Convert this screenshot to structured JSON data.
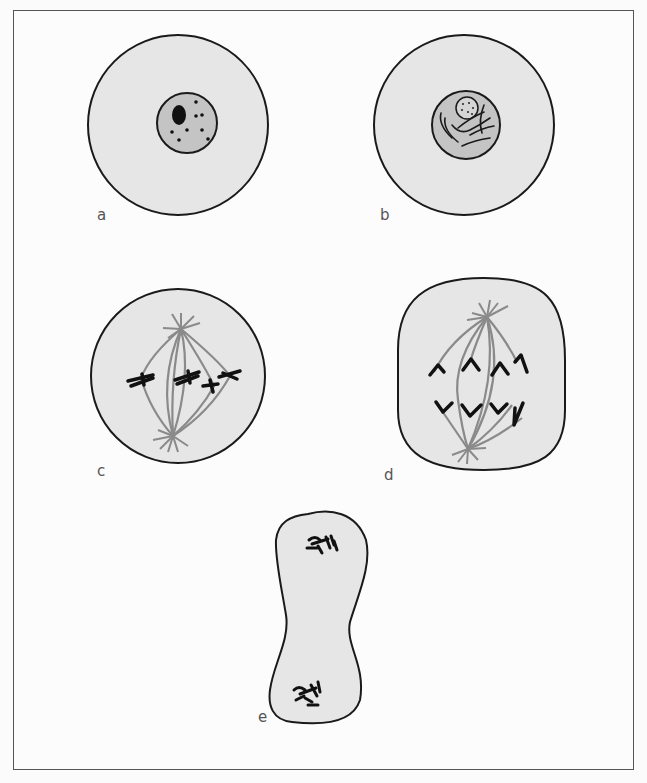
{
  "figure": {
    "panels": [
      {
        "id": "a",
        "label": "a",
        "stage": "interphase",
        "description": "Round cell with nucleus containing a dark nucleolus and scattered granules"
      },
      {
        "id": "b",
        "label": "b",
        "stage": "prophase",
        "description": "Round cell with nucleus containing dotted nucleolus and condensing chromatin threads"
      },
      {
        "id": "c",
        "label": "c",
        "stage": "metaphase",
        "description": "Spindle between two asters with chromosomes aligned at the equator"
      },
      {
        "id": "d",
        "label": "d",
        "stage": "anaphase",
        "description": "Elongated cell with V-shaped chromosomes moving toward spindle poles"
      },
      {
        "id": "e",
        "label": "e",
        "stage": "telophase",
        "description": "Pinching dumbbell-shaped cell with chromosome clusters at each end"
      }
    ]
  },
  "colors": {
    "cytoplasm": "#e6e6e6",
    "nucleus": "#c4c4c4",
    "outline": "#1a1a1a",
    "spindle": "#8a8a8a",
    "chromosome": "#111111",
    "frame": "#555555"
  }
}
